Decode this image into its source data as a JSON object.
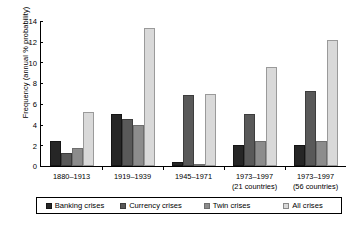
{
  "chart_data": {
    "type": "bar",
    "title": "",
    "xlabel": "",
    "ylabel": "Frequency (annual % probability)",
    "ylim": [
      0,
      14
    ],
    "yticks": [
      0,
      2,
      4,
      6,
      8,
      10,
      12,
      14
    ],
    "ytick_labels": [
      "0",
      "2",
      "4",
      "6",
      "8",
      "10",
      "12",
      "14"
    ],
    "grid": false,
    "legend_position": "bottom",
    "categories": [
      "1880–1913",
      "1919–1939",
      "1945–1971",
      "1973–1997",
      "1973–1997"
    ],
    "category_sublabels": [
      "",
      "",
      "",
      "(21 countries)",
      "(56 countries)"
    ],
    "series": [
      {
        "name": "Banking crises",
        "color": "#262626",
        "values": [
          2.4,
          5.0,
          0.4,
          2.0,
          2.0
        ]
      },
      {
        "name": "Currency crises",
        "color": "#595959",
        "values": [
          1.3,
          4.5,
          6.9,
          5.0,
          7.2
        ]
      },
      {
        "name": "Twin crises",
        "color": "#8c8c8c",
        "values": [
          1.7,
          4.0,
          0.2,
          2.4,
          2.4
        ]
      },
      {
        "name": "All crises",
        "color": "#d9d9d9",
        "values": [
          5.2,
          13.3,
          7.0,
          9.6,
          12.2
        ]
      }
    ]
  }
}
